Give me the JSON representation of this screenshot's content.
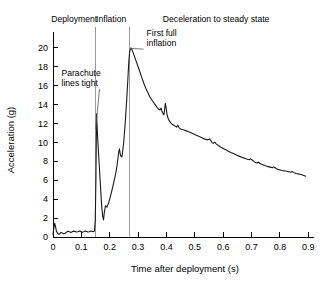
{
  "chart_data": {
    "type": "line",
    "title": "",
    "xlabel": "Time after deployment (s)",
    "ylabel": "Acceleration (g)",
    "xlim": [
      0,
      0.92
    ],
    "ylim": [
      0,
      21
    ],
    "grid": false,
    "legend": "none",
    "xticks": [
      "0",
      "0.1",
      "0.2",
      "0.3",
      "0.4",
      "0.5",
      "0.6",
      "0.7",
      "0.8",
      "0.9"
    ],
    "xtick_values": [
      0,
      0.1,
      0.2,
      0.3,
      0.4,
      0.5,
      0.6,
      0.7,
      0.8,
      0.9
    ],
    "yticks": [
      "0",
      "2",
      "4",
      "6",
      "8",
      "10",
      "12",
      "14",
      "16",
      "18",
      "20"
    ],
    "ytick_values": [
      0,
      2,
      4,
      6,
      8,
      10,
      12,
      14,
      16,
      18,
      20
    ],
    "series": [
      {
        "name": "Acceleration",
        "color": "#1a1a1a",
        "x": [
          0.0,
          0.003,
          0.006,
          0.009,
          0.012,
          0.016,
          0.02,
          0.024,
          0.028,
          0.033,
          0.038,
          0.043,
          0.048,
          0.053,
          0.058,
          0.063,
          0.068,
          0.073,
          0.078,
          0.083,
          0.088,
          0.093,
          0.098,
          0.103,
          0.108,
          0.113,
          0.118,
          0.123,
          0.128,
          0.133,
          0.138,
          0.142,
          0.146,
          0.149,
          0.1515,
          0.1535,
          0.156,
          0.159,
          0.163,
          0.167,
          0.171,
          0.175,
          0.178,
          0.181,
          0.185,
          0.19,
          0.196,
          0.203,
          0.21,
          0.216,
          0.221,
          0.225,
          0.228,
          0.231,
          0.234,
          0.238,
          0.243,
          0.249,
          0.255,
          0.26,
          0.264,
          0.267,
          0.27,
          0.274,
          0.278,
          0.283,
          0.289,
          0.296,
          0.303,
          0.311,
          0.319,
          0.327,
          0.335,
          0.343,
          0.351,
          0.359,
          0.366,
          0.372,
          0.377,
          0.381,
          0.384,
          0.388,
          0.391,
          0.394,
          0.396,
          0.399,
          0.402,
          0.406,
          0.41,
          0.415,
          0.42,
          0.426,
          0.431,
          0.436,
          0.44,
          0.444,
          0.449,
          0.455,
          0.462,
          0.47,
          0.478,
          0.487,
          0.496,
          0.505,
          0.514,
          0.523,
          0.531,
          0.539,
          0.546,
          0.552,
          0.557,
          0.561,
          0.565,
          0.57,
          0.576,
          0.583,
          0.591,
          0.6,
          0.609,
          0.618,
          0.627,
          0.636,
          0.645,
          0.654,
          0.663,
          0.671,
          0.678,
          0.685,
          0.691,
          0.697,
          0.703,
          0.709,
          0.714,
          0.719,
          0.724,
          0.729,
          0.735,
          0.742,
          0.749,
          0.756,
          0.762,
          0.768,
          0.773,
          0.778,
          0.783,
          0.788,
          0.793,
          0.799,
          0.805,
          0.812,
          0.819,
          0.826,
          0.832,
          0.838,
          0.843,
          0.848,
          0.853,
          0.858,
          0.864,
          0.87,
          0.876,
          0.882,
          0.887,
          0.89
        ],
        "y": [
          0.3,
          0.95,
          1.45,
          1.1,
          0.62,
          0.4,
          0.3,
          0.35,
          0.48,
          0.42,
          0.33,
          0.4,
          0.52,
          0.6,
          0.55,
          0.48,
          0.56,
          0.62,
          0.58,
          0.52,
          0.55,
          0.62,
          0.58,
          0.5,
          0.55,
          0.62,
          0.58,
          0.52,
          0.56,
          0.63,
          0.6,
          0.55,
          0.62,
          1.8,
          6.5,
          13.0,
          11.3,
          9.6,
          7.6,
          5.6,
          3.5,
          2.2,
          1.8,
          2.6,
          3.3,
          3.15,
          3.6,
          4.35,
          5.2,
          6.0,
          6.7,
          7.4,
          8.1,
          8.8,
          9.3,
          8.6,
          8.45,
          9.9,
          12.2,
          14.6,
          16.7,
          18.4,
          19.5,
          19.95,
          19.8,
          19.4,
          18.9,
          18.3,
          17.7,
          17.0,
          16.3,
          15.7,
          15.2,
          14.7,
          14.35,
          14.0,
          13.7,
          13.5,
          13.4,
          13.6,
          13.3,
          13.0,
          12.9,
          13.6,
          14.1,
          13.6,
          12.9,
          12.5,
          12.25,
          12.05,
          11.9,
          11.8,
          11.7,
          11.6,
          11.8,
          11.55,
          11.4,
          11.35,
          11.3,
          11.2,
          11.1,
          11.0,
          10.88,
          10.75,
          10.62,
          10.5,
          10.38,
          10.3,
          10.25,
          10.35,
          10.15,
          9.95,
          9.9,
          10.0,
          9.8,
          9.65,
          9.5,
          9.35,
          9.2,
          9.05,
          8.92,
          8.8,
          8.68,
          8.56,
          8.45,
          8.35,
          8.28,
          8.2,
          8.15,
          8.25,
          8.1,
          7.95,
          7.85,
          7.8,
          7.88,
          7.78,
          7.68,
          7.6,
          7.52,
          7.45,
          7.4,
          7.35,
          7.3,
          7.4,
          7.3,
          7.2,
          7.12,
          7.08,
          7.04,
          7.0,
          6.96,
          6.92,
          6.88,
          6.84,
          6.92,
          6.82,
          6.74,
          6.7,
          6.66,
          6.62,
          6.58,
          6.52,
          6.46,
          6.42
        ]
      }
    ],
    "phase_labels": [
      {
        "id": "deployment",
        "text": "Deployment",
        "x": 0.075
      },
      {
        "id": "inflation",
        "text": "Inflation",
        "x": 0.205
      },
      {
        "id": "deceleration",
        "text": "Deceleration to steady state",
        "x": 0.575
      }
    ],
    "phase_dividers": [
      {
        "id": "deployment-inflation-divider",
        "x": 0.15
      },
      {
        "id": "inflation-deceleration-divider",
        "x": 0.268
      }
    ],
    "annotations": [
      {
        "id": "parachute-lines-tight",
        "line1": "Parachute",
        "line2": "lines tight",
        "text_x": 0.03,
        "text_y": 17.0,
        "point_x": 0.1505,
        "point_y": 11.4
      },
      {
        "id": "first-full-inflation",
        "line1": "First full",
        "line2": "inflation",
        "text_x": 0.33,
        "text_y": 21.2,
        "point_x": 0.2715,
        "point_y": 19.9
      }
    ]
  }
}
